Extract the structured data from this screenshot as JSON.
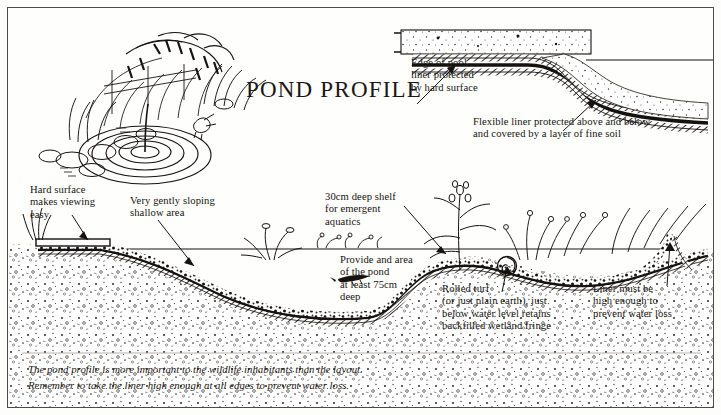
{
  "page": {
    "title": "POND PROFILE",
    "paper_color": "#fdfdfb",
    "ink_color": "#15120f",
    "border_color": "#4a4a4a"
  },
  "vignette": {
    "name": "pond-scene-illustration",
    "description": "line drawing of a wildlife pond with ripples, stones, reeds, fence and a bird"
  },
  "inset": {
    "name": "edge-detail-inset",
    "labels": {
      "edge_of_pool": "Edge of pool\nliner protected\nby hard surface",
      "flexible_liner": "Flexible liner protected above and below\nand covered by a layer of fine soil"
    }
  },
  "annotations": {
    "hard_surface": "Hard surface\nmakes viewing\neasy",
    "shallow_area": "Very gently sloping\nshallow area",
    "shelf": "30cm deep shelf\nfor emergent\naquatics",
    "deep_area": "Provide and area\nof the pond\nat least 75cm\ndeep",
    "rolled_turf": "Rolled turf\n(or just plain earth), just\nbelow water level retains\nbackfilled wetland fringe",
    "liner_height": "Liner must be\nhigh enough to\nprevent water loss"
  },
  "caption": "The pond profile is more important to the wildlife inhabitants than the layout.\nRemember to take the liner high enough at all edges to prevent water loss."
}
